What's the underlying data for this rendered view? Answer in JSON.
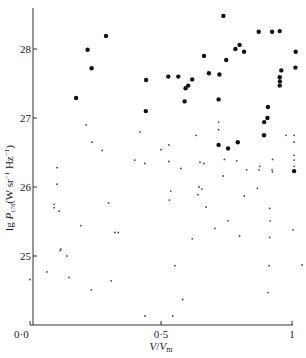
{
  "chart_data": {
    "type": "scatter",
    "title": "",
    "xlabel": "V/Vm",
    "xlabel_main": "V",
    "xlabel_sub_base": "V",
    "xlabel_sub": "m",
    "ylabel": "lg P178 (W sr−1 Hz−1)",
    "ylabel_prefix": "lg ",
    "ylabel_P": "P",
    "ylabel_sub": "178",
    "ylabel_units": "(W sr",
    "ylabel_units_sup1": "−1",
    "ylabel_units_mid": " Hz",
    "ylabel_units_sup2": "−1",
    "ylabel_units_end": ")",
    "xlim": [
      0.0,
      1.0
    ],
    "ylim": [
      24.0,
      28.6
    ],
    "grid": false,
    "legend": null,
    "x_ticks": [
      {
        "value": 0.0,
        "label": "0·0"
      },
      {
        "value": 0.5,
        "label": "0·5"
      },
      {
        "value": 1.0,
        "label": "1"
      }
    ],
    "y_ticks": [
      {
        "value": 25,
        "label": "25"
      },
      {
        "value": 26,
        "label": "26"
      },
      {
        "value": 27,
        "label": "27"
      },
      {
        "value": 28,
        "label": "28"
      }
    ],
    "series": [
      {
        "name": "large dots (high-luminosity sources)",
        "marker": "large-filled-circle",
        "points": [
          [
            0.29,
            28.19
          ],
          [
            0.22,
            27.99
          ],
          [
            0.235,
            27.72
          ],
          [
            0.176,
            27.29
          ],
          [
            0.443,
            27.55
          ],
          [
            0.442,
            27.1
          ],
          [
            0.738,
            28.48
          ],
          [
            0.873,
            28.25
          ],
          [
            0.924,
            28.25
          ],
          [
            0.953,
            28.26
          ],
          [
            0.8,
            28.06
          ],
          [
            0.784,
            28.0
          ],
          [
            0.817,
            27.96
          ],
          [
            1.014,
            27.96
          ],
          [
            0.664,
            27.9
          ],
          [
            0.749,
            27.84
          ],
          [
            1.013,
            27.73
          ],
          [
            0.959,
            27.69
          ],
          [
            0.683,
            27.65
          ],
          [
            0.723,
            27.63
          ],
          [
            0.528,
            27.6
          ],
          [
            0.566,
            27.6
          ],
          [
            0.619,
            27.56
          ],
          [
            0.953,
            27.59
          ],
          [
            0.954,
            27.53
          ],
          [
            0.953,
            27.47
          ],
          [
            0.604,
            27.47
          ],
          [
            0.594,
            27.43
          ],
          [
            0.59,
            27.24
          ],
          [
            0.72,
            27.27
          ],
          [
            0.906,
            27.0
          ],
          [
            0.908,
            27.16
          ],
          [
            0.894,
            26.94
          ],
          [
            0.893,
            26.75
          ],
          [
            0.793,
            26.65
          ],
          [
            0.756,
            26.56
          ],
          [
            0.72,
            26.61
          ],
          [
            1.008,
            26.23
          ]
        ]
      },
      {
        "name": "small dots (low-luminosity sources)",
        "marker": "small-dot",
        "points": [
          [
            0.214,
            26.9
          ],
          [
            0.42,
            26.8
          ],
          [
            0.237,
            26.65
          ],
          [
            0.275,
            26.53
          ],
          [
            0.4,
            26.39
          ],
          [
            0.438,
            26.34
          ],
          [
            0.103,
            26.28
          ],
          [
            0.103,
            26.04
          ],
          [
            0.092,
            25.75
          ],
          [
            0.092,
            25.7
          ],
          [
            0.111,
            25.65
          ],
          [
            0.194,
            25.44
          ],
          [
            0.3,
            25.77
          ],
          [
            0.324,
            25.34
          ],
          [
            0.337,
            25.34
          ],
          [
            0.118,
            25.1
          ],
          [
            0.115,
            25.08
          ],
          [
            0.141,
            25.0
          ],
          [
            0.065,
            24.77
          ],
          [
            0.149,
            24.69
          ],
          [
            0.234,
            24.51
          ],
          [
            0.31,
            24.64
          ],
          [
            0.439,
            24.13
          ],
          [
            0.0,
            24.66
          ],
          [
            0.53,
            26.61
          ],
          [
            0.5,
            26.54
          ],
          [
            0.53,
            26.37
          ],
          [
            0.576,
            26.27
          ],
          [
            0.634,
            26.75
          ],
          [
            0.649,
            26.36
          ],
          [
            0.664,
            26.34
          ],
          [
            0.72,
            26.94
          ],
          [
            0.72,
            26.83
          ],
          [
            0.737,
            26.16
          ],
          [
            0.645,
            26.0
          ],
          [
            0.656,
            25.97
          ],
          [
            0.641,
            25.89
          ],
          [
            0.537,
            25.94
          ],
          [
            0.742,
            26.4
          ],
          [
            0.789,
            26.38
          ],
          [
            0.827,
            26.25
          ],
          [
            0.877,
            26.3
          ],
          [
            0.874,
            26.25
          ],
          [
            0.926,
            26.4
          ],
          [
            0.924,
            26.25
          ],
          [
            0.925,
            26.22
          ],
          [
            1.008,
            26.75
          ],
          [
            1.008,
            26.65
          ],
          [
            1.008,
            26.46
          ],
          [
            1.008,
            26.39
          ],
          [
            1.008,
            26.3
          ],
          [
            0.977,
            26.75
          ],
          [
            0.868,
            25.98
          ],
          [
            0.818,
            25.87
          ],
          [
            0.915,
            25.69
          ],
          [
            0.916,
            25.51
          ],
          [
            0.756,
            25.51
          ],
          [
            1.004,
            25.38
          ],
          [
            0.8,
            25.29
          ],
          [
            0.915,
            25.27
          ],
          [
            0.672,
            25.71
          ],
          [
            0.706,
            25.4
          ],
          [
            0.619,
            25.25
          ],
          [
            0.532,
            25.81
          ],
          [
            0.553,
            24.86
          ],
          [
            0.913,
            24.86
          ],
          [
            1.038,
            24.87
          ],
          [
            0.583,
            24.37
          ],
          [
            0.908,
            24.47
          ],
          [
            0.545,
            24.13
          ]
        ]
      }
    ]
  }
}
